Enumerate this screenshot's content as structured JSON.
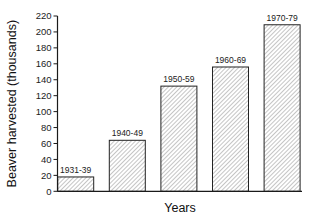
{
  "chart_data": {
    "type": "bar",
    "title": "",
    "xlabel": "Years",
    "ylabel": "Beaver harvested (thousands)",
    "categories": [
      "1931-39",
      "1940-49",
      "1950-59",
      "1960-69",
      "1970-79"
    ],
    "values": [
      18,
      64,
      132,
      156,
      209
    ],
    "ylim": [
      0,
      220
    ],
    "yticks": [
      0,
      20,
      40,
      60,
      80,
      100,
      120,
      140,
      160,
      180,
      200,
      220
    ],
    "grid": false,
    "legend": null,
    "bar_fill": "diagonal-hatch",
    "bar_labels_above": true
  },
  "colors": {
    "axis": "#1a1a1a",
    "hatch": "#9a9a9a",
    "bar_outline": "#222222"
  }
}
